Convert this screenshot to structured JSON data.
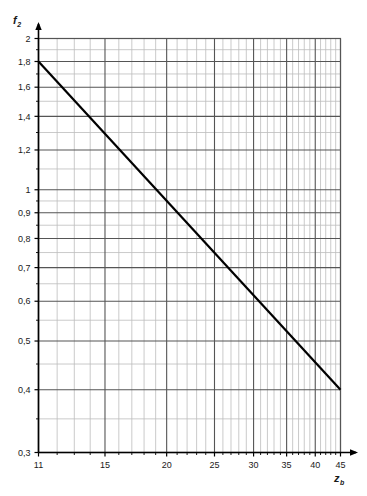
{
  "chart_data": {
    "type": "line",
    "title": "",
    "subtitle": "",
    "xlabel": "z",
    "xlabel_sub": "b",
    "ylabel": "f",
    "ylabel_sub": "2",
    "xscale": "log",
    "yscale": "log",
    "xlim": [
      11,
      45
    ],
    "ylim": [
      0.3,
      2
    ],
    "grid": true,
    "legend": false,
    "legend_position": "none",
    "x_major_ticks": [
      11,
      15,
      20,
      25,
      30,
      35,
      40,
      45
    ],
    "x_major_tick_labels": [
      "11",
      "15",
      "20",
      "25",
      "30",
      "35",
      "40",
      "45"
    ],
    "x_minor_ticks": [
      12,
      13,
      14,
      16,
      17,
      18,
      19,
      21,
      22,
      23,
      24,
      26,
      27,
      28,
      29,
      31,
      32,
      33,
      34,
      36,
      37,
      38,
      39,
      41,
      42,
      43,
      44
    ],
    "y_major_ticks": [
      2,
      1.8,
      1.6,
      1.4,
      1.2,
      1,
      0.9,
      0.8,
      0.7,
      0.6,
      0.5,
      0.4,
      0.3
    ],
    "y_major_tick_labels": [
      "2",
      "1,8",
      "1,6",
      "1,4",
      "1,2",
      "1",
      "0,9",
      "0,8",
      "0,7",
      "0,6",
      "0,5",
      "0,4",
      "0,3"
    ],
    "y_minor_ticks": [
      1.9,
      1.7,
      1.5,
      1.3,
      1.1,
      0.95,
      0.85,
      0.75,
      0.65,
      0.55,
      0.45,
      0.35
    ],
    "series": [
      {
        "name": "f2 curve",
        "x": [
          11,
          45
        ],
        "values": [
          1.8,
          0.4
        ],
        "color": "#000000",
        "linewidth": 2.2
      }
    ],
    "axis_color": "#000000",
    "grid_major_color": "#555555",
    "grid_minor_color": "#bdbdbd",
    "background_color": "#ffffff"
  }
}
